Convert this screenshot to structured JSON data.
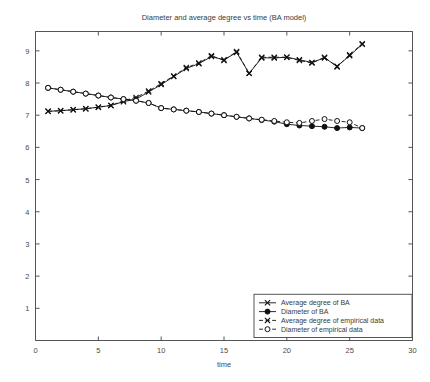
{
  "figure": {
    "title": "Diameter and average degree vs  time (BA model)",
    "background": "#ffffff",
    "foreground": "#111111"
  },
  "axes": {
    "xlabel": "time",
    "ylabel": "",
    "xlim": [
      0,
      30
    ],
    "ylim": [
      0,
      9.6
    ],
    "xticks": [
      0,
      5,
      10,
      15,
      20,
      25,
      30
    ],
    "xtick_labels": [
      "0",
      "5",
      "10",
      "15",
      "20",
      "25",
      "30"
    ],
    "yticks": [
      1,
      2,
      3,
      4,
      5,
      6,
      7,
      8,
      9
    ],
    "ytick_labels": [
      "1",
      "2",
      "3",
      "4",
      "5",
      "6",
      "7",
      "8",
      "9"
    ],
    "grid": false
  },
  "legend": {
    "position": "lower right",
    "entries": [
      {
        "label": "Average degree of BA",
        "marker": "x",
        "linestyle": "solid"
      },
      {
        "label": "Diameter of BA",
        "marker": "circle-filled",
        "linestyle": "solid"
      },
      {
        "label": "Average degree of empirical data",
        "marker": "x",
        "linestyle": "dashed"
      },
      {
        "label": "Diameter of empirical data",
        "marker": "circle-open",
        "linestyle": "dashed"
      }
    ]
  },
  "chart_data": {
    "type": "line",
    "title": "Diameter and average degree vs  time (BA model)",
    "xlabel": "time",
    "ylabel": "",
    "xlim": [
      0,
      30
    ],
    "ylim": [
      0,
      9.6
    ],
    "grid": false,
    "legend_position": "lower right",
    "series": [
      {
        "name": "Average degree of BA",
        "marker": "x",
        "linestyle": "solid",
        "x": [
          1,
          2,
          3,
          4,
          5,
          6,
          7,
          8,
          9,
          10,
          11,
          12,
          13,
          14,
          15,
          16,
          17,
          18,
          19,
          20,
          21,
          22,
          23,
          24,
          25,
          26
        ],
        "y": [
          7.12,
          7.14,
          7.17,
          7.2,
          7.25,
          7.3,
          7.42,
          7.5,
          7.72,
          7.95,
          8.2,
          8.45,
          8.6,
          8.82,
          8.72,
          8.95,
          8.3,
          8.78,
          8.78,
          8.8,
          8.72,
          8.64,
          8.78,
          8.52,
          8.85,
          9.2
        ]
      },
      {
        "name": "Diameter of BA",
        "marker": "circle-filled",
        "linestyle": "solid",
        "x": [
          1,
          2,
          3,
          4,
          5,
          6,
          7,
          8,
          9,
          10,
          11,
          12,
          13,
          14,
          15,
          16,
          17,
          18,
          19,
          20,
          21,
          22,
          23,
          24,
          25,
          26
        ],
        "y": [
          7.85,
          7.79,
          7.73,
          7.67,
          7.61,
          7.55,
          7.5,
          7.45,
          7.38,
          7.22,
          7.18,
          7.14,
          7.1,
          7.05,
          7.0,
          6.95,
          6.9,
          6.85,
          6.8,
          6.72,
          6.68,
          6.66,
          6.64,
          6.6,
          6.62,
          6.6
        ]
      },
      {
        "name": "Average degree of empirical data",
        "marker": "x",
        "linestyle": "dashed",
        "x": [
          1,
          2,
          3,
          4,
          5,
          6,
          7,
          8,
          9,
          10,
          11,
          12,
          13,
          14,
          15,
          16,
          17,
          18,
          19,
          20,
          21,
          22,
          23,
          24,
          25,
          26
        ],
        "y": [
          7.12,
          7.14,
          7.17,
          7.2,
          7.25,
          7.3,
          7.45,
          7.55,
          7.75,
          7.98,
          8.22,
          8.48,
          8.62,
          8.85,
          8.7,
          8.98,
          8.3,
          8.8,
          8.8,
          8.8,
          8.7,
          8.62,
          8.8,
          8.5,
          8.88,
          9.22
        ]
      },
      {
        "name": "Diameter of empirical data",
        "marker": "circle-open",
        "linestyle": "dashed",
        "x": [
          1,
          2,
          3,
          4,
          5,
          6,
          7,
          8,
          9,
          10,
          11,
          12,
          13,
          14,
          15,
          16,
          17,
          18,
          19,
          20,
          21,
          22,
          23,
          24,
          25,
          26
        ],
        "y": [
          7.85,
          7.79,
          7.73,
          7.67,
          7.61,
          7.55,
          7.5,
          7.45,
          7.38,
          7.22,
          7.18,
          7.14,
          7.1,
          7.05,
          7.0,
          6.95,
          6.9,
          6.86,
          6.82,
          6.78,
          6.76,
          6.82,
          6.88,
          6.82,
          6.78,
          6.6
        ]
      }
    ]
  }
}
